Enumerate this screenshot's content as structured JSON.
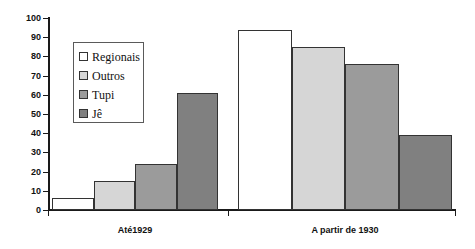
{
  "chart_data": {
    "type": "bar",
    "title": "",
    "subtitle": "",
    "xlabel": "",
    "ylabel": "",
    "ylim": [
      0,
      100
    ],
    "yticks": [
      0,
      10,
      20,
      30,
      40,
      50,
      60,
      70,
      80,
      90,
      100
    ],
    "grid": false,
    "legend_position": "upper-left-inside",
    "categories": [
      "Até1929",
      "A partir de 1930"
    ],
    "series": [
      {
        "name": "Regionais",
        "values": [
          6,
          94
        ],
        "color": "#ffffff"
      },
      {
        "name": "Outros",
        "values": [
          15,
          85
        ],
        "color": "#d6d6d6"
      },
      {
        "name": "Tupi",
        "values": [
          24,
          76
        ],
        "color": "#9b9b9b"
      },
      {
        "name": "Jê",
        "values": [
          61,
          39
        ],
        "color": "#808080"
      }
    ]
  },
  "axis": {
    "tick_labels": [
      "0",
      "10",
      "20",
      "30",
      "40",
      "50",
      "60",
      "70",
      "80",
      "90",
      "100"
    ]
  },
  "legend": {
    "items": [
      {
        "label": "Regionais"
      },
      {
        "label": "Outros"
      },
      {
        "label": "Tupi"
      },
      {
        "label": "Jê"
      }
    ]
  },
  "groups": [
    {
      "label": "Até1929"
    },
    {
      "label": "A partir de 1930"
    }
  ]
}
